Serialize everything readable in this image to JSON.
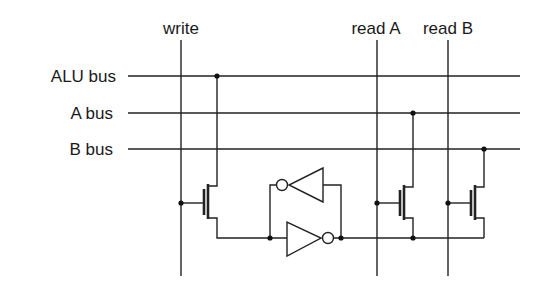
{
  "diagram": {
    "column_labels": {
      "write": "write",
      "read_a": "read A",
      "read_b": "read B"
    },
    "row_labels": {
      "alu_bus": "ALU bus",
      "a_bus": "A bus",
      "b_bus": "B bus"
    },
    "components": [
      {
        "type": "transistor",
        "name": "write-transistor",
        "gate": "write",
        "drain": "ALU bus"
      },
      {
        "type": "inverter",
        "name": "forward-inverter"
      },
      {
        "type": "inverter",
        "name": "feedback-inverter"
      },
      {
        "type": "transistor",
        "name": "read-a-transistor",
        "gate": "read A",
        "drain": "A bus"
      },
      {
        "type": "transistor",
        "name": "read-b-transistor",
        "gate": "read B",
        "drain": "B bus"
      }
    ],
    "colors": {
      "line": "#222222",
      "background": "#ffffff"
    }
  }
}
